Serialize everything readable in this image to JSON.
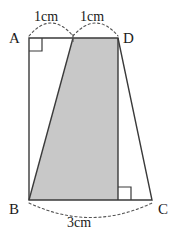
{
  "figure": {
    "shape_type": "trapezoid",
    "fill_color": "#c8c8c8",
    "stroke_color": "#3a3a3a",
    "dash_color": "#555555",
    "background_color": "#ffffff",
    "vertices": [
      {
        "name": "A",
        "label": "A",
        "x": 29,
        "y": 38,
        "label_x": 9,
        "label_y": 31
      },
      {
        "name": "B",
        "label": "B",
        "x": 29,
        "y": 200,
        "label_x": 9,
        "label_y": 202
      },
      {
        "name": "C",
        "label": "C",
        "x": 152,
        "y": 200,
        "label_x": 158,
        "label_y": 202
      },
      {
        "name": "D",
        "label": "D",
        "x": 118,
        "y": 38,
        "label_x": 123,
        "label_y": 31
      }
    ],
    "interior_points": [
      {
        "name": "M",
        "description": "midpoint of AD",
        "x": 73,
        "y": 38
      },
      {
        "name": "N",
        "description": "foot of perpendicular from D to BC",
        "x": 118,
        "y": 200
      }
    ],
    "shaded_region": {
      "name": "shaded-quadrilateral",
      "vertices_order": [
        "B",
        "M",
        "D",
        "N"
      ],
      "points": "29,200 73,38 118,38 118,200"
    },
    "outline": {
      "name": "trapezoid-outline",
      "points": "29,38 118,38 152,200 29,200"
    },
    "right_angles": [
      {
        "name": "right-angle-at-A",
        "x": 29,
        "y": 38,
        "size": 13,
        "dir_x": 1,
        "dir_y": 1
      },
      {
        "name": "right-angle-at-N",
        "x": 118,
        "y": 200,
        "size": 13,
        "dir_x": 1,
        "dir_y": -1
      }
    ],
    "measures": [
      {
        "name": "segment-am",
        "label": "1cm",
        "from": "A",
        "to": "M",
        "arc": "M 29 36 Q 51 10 73 36",
        "label_x": 34,
        "label_y": 10
      },
      {
        "name": "segment-md",
        "label": "1cm",
        "from": "M",
        "to": "D",
        "arc": "M 73 36 Q 96 10 118 36",
        "label_x": 80,
        "label_y": 10
      },
      {
        "name": "segment-bc",
        "label": "3cm",
        "from": "B",
        "to": "C",
        "arc": "M 29 203 Q 91 232 152 203",
        "label_x": 67,
        "label_y": 216
      }
    ]
  }
}
